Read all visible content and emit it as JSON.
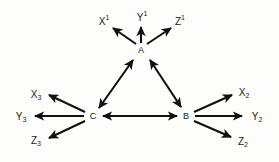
{
  "diagram": {
    "type": "directed-graph",
    "background_color": "#fdfdfb",
    "line_color": "#111111",
    "text_color": "#1a1a1a",
    "latent_nodes": [
      {
        "id": "A",
        "label": "A",
        "x": 141,
        "y": 50
      },
      {
        "id": "B",
        "label": "B",
        "x": 186,
        "y": 116
      },
      {
        "id": "C",
        "label": "C",
        "x": 93,
        "y": 116
      }
    ],
    "observed_nodes": [
      {
        "id": "X1",
        "base": "X",
        "affix": "1",
        "affix_kind": "superscript",
        "x": 104,
        "y": 22,
        "parent": "A"
      },
      {
        "id": "Y1",
        "base": "Y",
        "affix": "1",
        "affix_kind": "superscript",
        "x": 142,
        "y": 18,
        "parent": "A"
      },
      {
        "id": "Z1",
        "base": "Z",
        "affix": "1",
        "affix_kind": "superscript",
        "x": 180,
        "y": 22,
        "parent": "A"
      },
      {
        "id": "X2",
        "base": "X",
        "affix": "2",
        "affix_kind": "subscript",
        "x": 244,
        "y": 93,
        "parent": "B"
      },
      {
        "id": "Y2",
        "base": "Y",
        "affix": "2",
        "affix_kind": "subscript",
        "x": 257,
        "y": 117,
        "parent": "B"
      },
      {
        "id": "Z2",
        "base": "Z",
        "affix": "2",
        "affix_kind": "subscript",
        "x": 243,
        "y": 142,
        "parent": "B"
      },
      {
        "id": "X3",
        "base": "X",
        "affix": "3",
        "affix_kind": "subscript",
        "x": 36,
        "y": 95,
        "parent": "C"
      },
      {
        "id": "Y3",
        "base": "Y",
        "affix": "3",
        "affix_kind": "subscript",
        "x": 21,
        "y": 117,
        "parent": "C"
      },
      {
        "id": "Z3",
        "base": "Z",
        "affix": "3",
        "affix_kind": "subscript",
        "x": 36,
        "y": 141,
        "parent": "C"
      }
    ],
    "bidirectional_edges": [
      {
        "id": "edge-c-a",
        "from": "C",
        "to": "A",
        "arrowheads": "both"
      },
      {
        "id": "edge-a-b",
        "from": "A",
        "to": "B",
        "arrowheads": "both"
      },
      {
        "id": "edge-c-b",
        "from": "C",
        "to": "B",
        "arrowheads": "both"
      }
    ],
    "directed_edges": [
      {
        "id": "edge-a-x1",
        "from": "A",
        "to": "X1",
        "arrowheads": "target"
      },
      {
        "id": "edge-a-y1",
        "from": "A",
        "to": "Y1",
        "arrowheads": "target"
      },
      {
        "id": "edge-a-z1",
        "from": "A",
        "to": "Z1",
        "arrowheads": "target"
      },
      {
        "id": "edge-b-x2",
        "from": "B",
        "to": "X2",
        "arrowheads": "target"
      },
      {
        "id": "edge-b-y2",
        "from": "B",
        "to": "Y2",
        "arrowheads": "target"
      },
      {
        "id": "edge-b-z2",
        "from": "B",
        "to": "Z2",
        "arrowheads": "target"
      },
      {
        "id": "edge-c-x3",
        "from": "C",
        "to": "X3",
        "arrowheads": "target"
      },
      {
        "id": "edge-c-y3",
        "from": "C",
        "to": "Y3",
        "arrowheads": "target"
      },
      {
        "id": "edge-c-z3",
        "from": "C",
        "to": "Z3",
        "arrowheads": "target"
      }
    ]
  }
}
